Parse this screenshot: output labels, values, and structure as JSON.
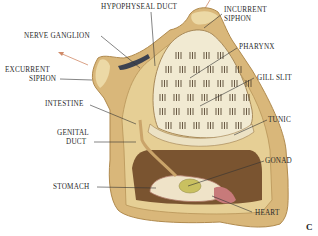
{
  "figure": {
    "panel_letter": "C",
    "labels": {
      "hypophyseal_duct": "HYPOPHYSEAL DUCT",
      "incurrent_siphon_1": "INCURRENT",
      "incurrent_siphon_2": "SIPHON",
      "nerve_ganglion": "NERVE GANGLION",
      "pharynx": "PHARYNX",
      "excurrent_siphon_1": "EXCURRENT",
      "excurrent_siphon_2": "SIPHON",
      "gill_slit": "GILL SLIT",
      "intestine": "INTESTINE",
      "tunic": "TUNIC",
      "genital_duct_1": "GENITAL",
      "genital_duct_2": "DUCT",
      "gonad": "GONAD",
      "stomach": "STOMACH",
      "heart": "HEART"
    },
    "colors": {
      "tunic": "#d9b77a",
      "tunic_light": "#ecd9a6",
      "tunic_shadow": "#b08a4e",
      "pharynx": "#f1ead2",
      "gill_slit": "#5a4a34",
      "cavity": "#7a5430",
      "gonad": "#c9c060",
      "heart": "#c77a7a",
      "arrow": "#d08a68",
      "leader": "#333333"
    }
  }
}
